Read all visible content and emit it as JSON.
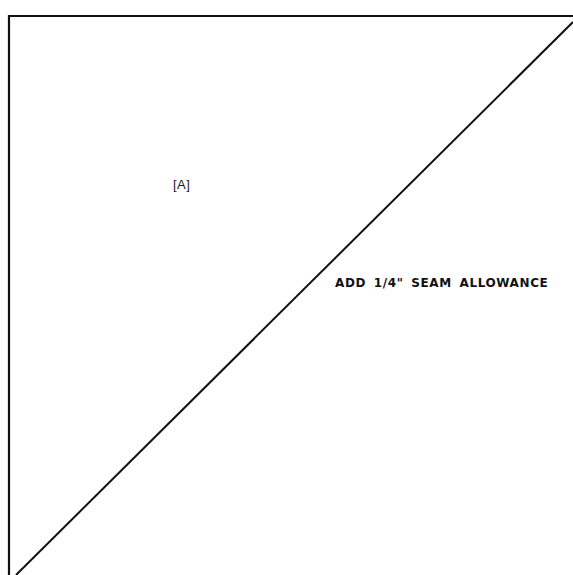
{
  "diagram": {
    "piece_label": "[A]",
    "instruction": "ADD 1/4\" SEAM ALLOWANCE",
    "shape": "right-triangle",
    "line_color": "#111111"
  }
}
